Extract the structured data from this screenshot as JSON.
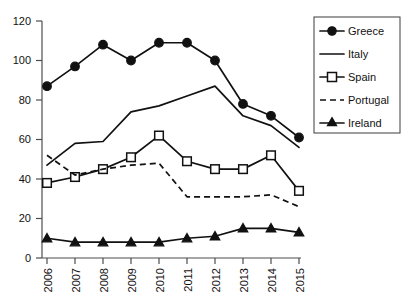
{
  "chart_data": {
    "type": "line",
    "title": "",
    "subtitle": "",
    "xlabel": "",
    "ylabel": "",
    "categories": [
      "2006",
      "2007",
      "2008",
      "2009",
      "2010",
      "2011",
      "2012",
      "2013",
      "2014",
      "2015"
    ],
    "xtick_labels": [
      "2006",
      "2007",
      "2008",
      "2009",
      "2010",
      "2011",
      "2012",
      "2013",
      "2014",
      "2015"
    ],
    "ytick_labels": [
      "0",
      "20",
      "40",
      "60",
      "80",
      "100",
      "120"
    ],
    "ytick_values": [
      0,
      20,
      40,
      60,
      80,
      100,
      120
    ],
    "ylim": [
      0,
      120
    ],
    "grid": false,
    "legend_position": "right",
    "series": [
      {
        "name": "Greece",
        "marker": "filled-circle",
        "line_style": "solid",
        "color": "#111111",
        "values": [
          87,
          97,
          108,
          100,
          109,
          109,
          100,
          78,
          72,
          61
        ]
      },
      {
        "name": "Italy",
        "marker": "none",
        "line_style": "solid",
        "color": "#111111",
        "values": [
          47,
          58,
          59,
          74,
          77,
          82,
          87,
          72,
          67,
          56
        ]
      },
      {
        "name": "Spain",
        "marker": "open-square",
        "line_style": "solid",
        "color": "#111111",
        "values": [
          38,
          41,
          45,
          51,
          62,
          49,
          45,
          45,
          52,
          34
        ]
      },
      {
        "name": "Portugal",
        "marker": "none",
        "line_style": "dashed",
        "color": "#111111",
        "values": [
          52,
          42,
          45,
          47,
          48,
          31,
          31,
          31,
          32,
          26
        ]
      },
      {
        "name": "Ireland",
        "marker": "filled-triangle",
        "line_style": "solid",
        "color": "#111111",
        "values": [
          10,
          8,
          8,
          8,
          8,
          10,
          11,
          15,
          15,
          13
        ]
      }
    ]
  },
  "legend": {
    "entries": [
      {
        "label": "Greece"
      },
      {
        "label": "Italy"
      },
      {
        "label": "Spain"
      },
      {
        "label": "Portugal"
      },
      {
        "label": "Ireland"
      }
    ]
  },
  "axes": {
    "y_labels": [
      "120",
      "100",
      "80",
      "60",
      "40",
      "20",
      "0"
    ],
    "x_labels": [
      "2006",
      "2007",
      "2008",
      "2009",
      "2010",
      "2011",
      "2012",
      "2013",
      "2014",
      "2015"
    ]
  }
}
